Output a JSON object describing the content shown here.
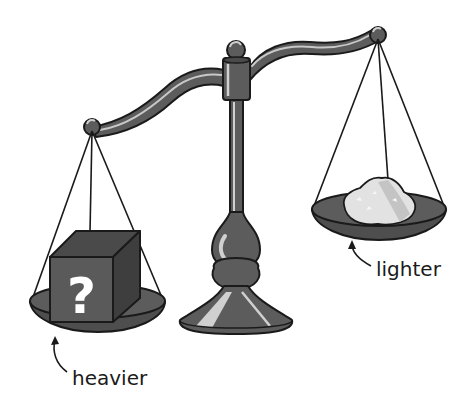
{
  "diagram": {
    "left_pan": {
      "object": "mystery-cube",
      "object_symbol": "?",
      "label": "heavier",
      "position": "low"
    },
    "right_pan": {
      "object": "powder-pile",
      "label": "lighter",
      "position": "high"
    },
    "colors": {
      "metal_dark": "#555555",
      "metal_mid": "#6a6a6a",
      "highlight": "#d0d0d0",
      "outline": "#1a1a1a",
      "cube_front": "#5a5a5a",
      "cube_top": "#4a4a4a",
      "cube_side": "#3e3e3e",
      "powder": "#e2e2e2",
      "background": "#ffffff"
    }
  }
}
